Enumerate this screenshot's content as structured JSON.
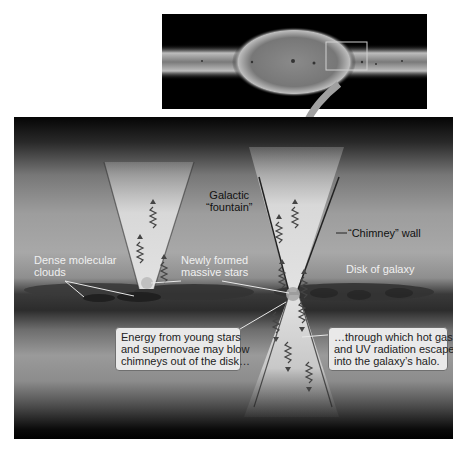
{
  "overview": {
    "description": "Edge-on view of a spiral galaxy with central bulge",
    "highlight_box": {
      "label": "zoom region"
    }
  },
  "panel": {
    "labels": {
      "galactic_fountain_line1": "Galactic",
      "galactic_fountain_line2": "“fountain”",
      "chimney_wall": "“Chimney” wall",
      "dense_clouds_line1": "Dense molecular",
      "dense_clouds_line2": "clouds",
      "newly_formed_line1": "Newly formed",
      "newly_formed_line2": "massive stars",
      "disk_of_galaxy": "Disk of galaxy"
    },
    "callouts": [
      {
        "lines": [
          "Energy from young stars",
          "and supernovae may blow",
          "chimneys out of the disk…"
        ]
      },
      {
        "lines": [
          "…through which hot gas",
          "and UV radiation escape",
          "into the galaxy’s halo."
        ]
      }
    ]
  },
  "colors": {
    "background": "#ffffff",
    "space": "#000000",
    "cone": "#d6d6d6",
    "callout_bg": "#e9e9e9",
    "arrow": "#9a9a9a"
  }
}
